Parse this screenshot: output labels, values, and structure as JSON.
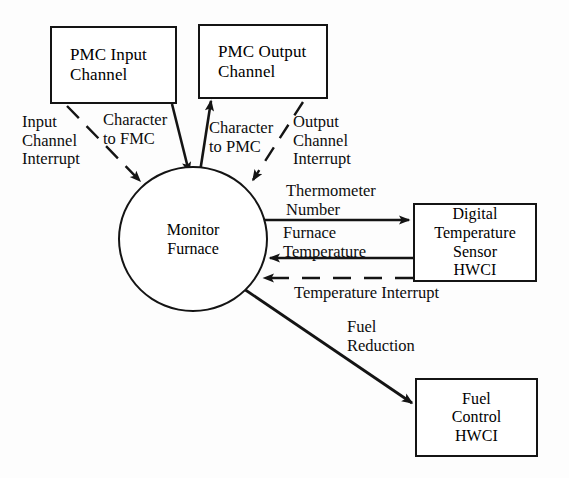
{
  "diagram": {
    "background_color": "#fdfdfd",
    "stroke_color": "#141414",
    "nodes": {
      "pmc_input_channel": {
        "line1": "PMC Input",
        "line2": "Channel"
      },
      "pmc_output_channel": {
        "line1": "PMC Output",
        "line2": "Channel"
      },
      "monitor_furnace": {
        "line1": "Monitor",
        "line2": "Furnace"
      },
      "digital_temperature_sensor": {
        "line1": "Digital",
        "line2": "Temperature",
        "line3": "Sensor",
        "line4": "HWCI"
      },
      "fuel_control": {
        "line1": "Fuel",
        "line2": "Control",
        "line3": "HWCI"
      }
    },
    "flows": {
      "input_channel_interrupt": {
        "line1": "Input",
        "line2": "Channel",
        "line3": "Interrupt"
      },
      "character_to_fmc": {
        "line1": "Character",
        "line2": "to FMC"
      },
      "character_to_pmc": {
        "line1": "Character",
        "line2": "to PMC"
      },
      "output_channel_interrupt": {
        "line1": "Output",
        "line2": "Channel",
        "line3": "Interrupt"
      },
      "thermometer_number": {
        "line1": "Thermometer",
        "line2": "Number"
      },
      "furnace_temperature": {
        "line1": "Furnace",
        "line2": "Temperature"
      },
      "temperature_interrupt": {
        "line1": "Temperature Interrupt"
      },
      "fuel_reduction": {
        "line1": "Fuel",
        "line2": "Reduction"
      }
    }
  }
}
